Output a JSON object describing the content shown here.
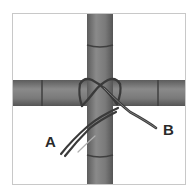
{
  "diagram": {
    "labels": {
      "a": "A",
      "b": "B"
    },
    "colors": {
      "background": "#ffffff",
      "frame": "#c8c8c8",
      "pole_fill": "#7a7a7a",
      "pole_highlight": "#9a9a9a",
      "pole_shadow": "#5a5a5a",
      "node": "#3f3f3f",
      "rope": "#3a3a3a",
      "rope_light": "#b0b0b0",
      "label": "#2a2a2a"
    }
  }
}
